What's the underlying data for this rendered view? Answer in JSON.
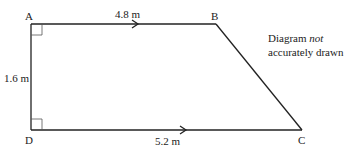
{
  "diagram": {
    "type": "trapezium",
    "vertices": {
      "A": {
        "label": "A",
        "x": 31,
        "y": 24
      },
      "B": {
        "label": "B",
        "x": 216,
        "y": 24
      },
      "C": {
        "label": "C",
        "x": 302,
        "y": 130
      },
      "D": {
        "label": "D",
        "x": 31,
        "y": 130
      }
    },
    "sides": {
      "AB": {
        "length_label": "4.8 m",
        "parallel_arrow": true
      },
      "DC": {
        "length_label": "5.2 m",
        "parallel_arrow": true
      },
      "AD": {
        "length_label": "1.6 m"
      },
      "BC": {}
    },
    "right_angles": [
      "A",
      "D"
    ],
    "note": {
      "prefix": "Diagram ",
      "emphasis": "not",
      "line2": "accurately drawn"
    },
    "stroke_color": "#222222"
  }
}
